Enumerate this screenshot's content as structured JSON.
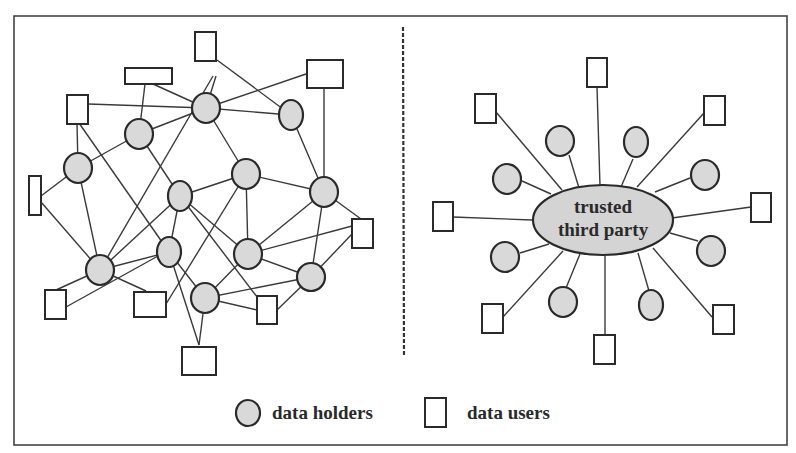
{
  "figure": {
    "left_panel": "decentralized network of data holders and data users",
    "right_panel": "star network centered on a trusted third party"
  },
  "center_node": {
    "line1": "trusted",
    "line2": "third party"
  },
  "legend": {
    "holders_label": "data holders",
    "users_label": "data users"
  },
  "colors": {
    "holder_fill": "#d9d9d9",
    "ttp_fill": "#d4d4d4",
    "stroke": "#2a2a2a"
  }
}
